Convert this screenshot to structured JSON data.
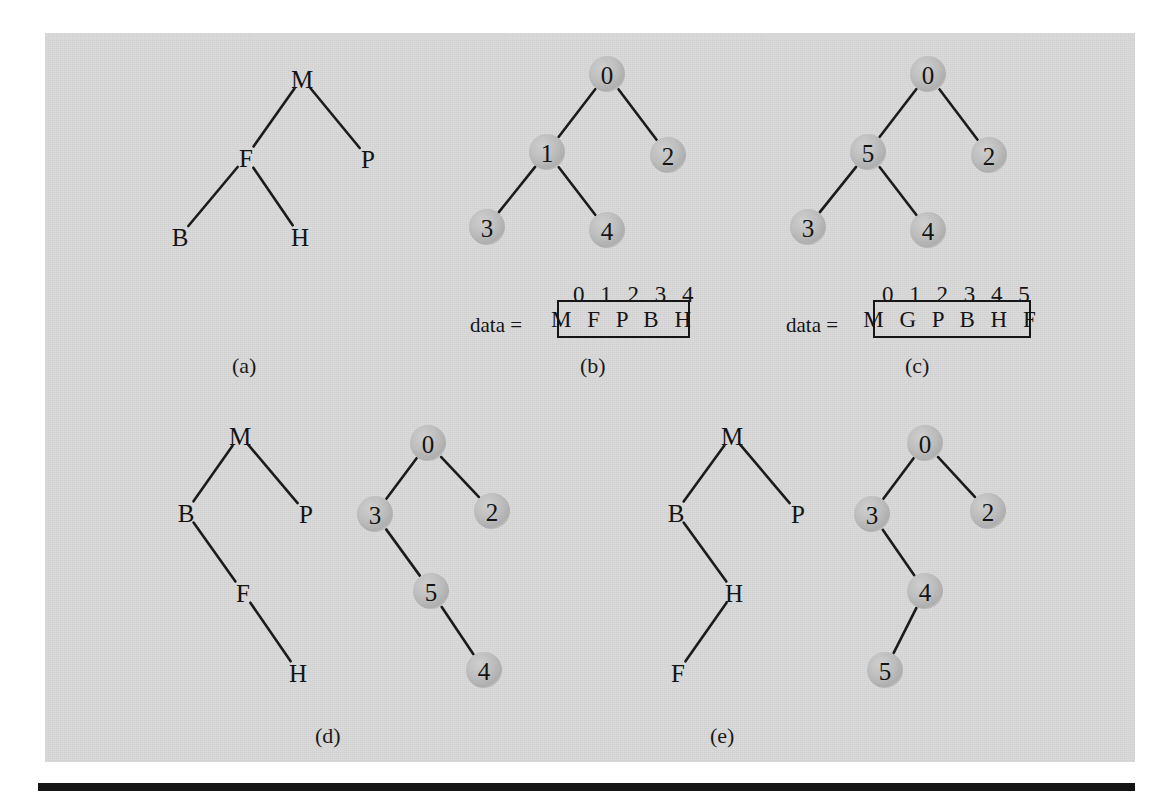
{
  "figure": {
    "background_color": "#ffffff",
    "plate_color": "#d7d7d7",
    "node_fill_color": "#b5b5b5",
    "ink_color": "#141414",
    "rule_color": "#151515"
  },
  "panels": [
    {
      "id": "a",
      "caption": "(a)",
      "kind": "letter-tree",
      "nodes": [
        {
          "label": "M",
          "x": 302,
          "y": 78
        },
        {
          "label": "F",
          "x": 246,
          "y": 157
        },
        {
          "label": "P",
          "x": 368,
          "y": 158
        },
        {
          "label": "B",
          "x": 180,
          "y": 236
        },
        {
          "label": "H",
          "x": 300,
          "y": 236
        }
      ],
      "edges": [
        {
          "from": "M",
          "to": "F"
        },
        {
          "from": "M",
          "to": "P"
        },
        {
          "from": "F",
          "to": "B"
        },
        {
          "from": "F",
          "to": "H"
        }
      ]
    },
    {
      "id": "b",
      "caption": "(b)",
      "kind": "number-tree",
      "nodes": [
        {
          "label": "0",
          "x": 607,
          "y": 74
        },
        {
          "label": "1",
          "x": 547,
          "y": 152
        },
        {
          "label": "2",
          "x": 668,
          "y": 155
        },
        {
          "label": "3",
          "x": 487,
          "y": 227
        },
        {
          "label": "4",
          "x": 607,
          "y": 230
        }
      ],
      "edges": [
        {
          "from": "0",
          "to": "1"
        },
        {
          "from": "0",
          "to": "2"
        },
        {
          "from": "1",
          "to": "3"
        },
        {
          "from": "1",
          "to": "4"
        }
      ],
      "array": {
        "name": "data =",
        "indices": [
          "0",
          "1",
          "2",
          "3",
          "4"
        ],
        "values": [
          "M",
          "F",
          "P",
          "B",
          "H"
        ]
      }
    },
    {
      "id": "c",
      "caption": "(c)",
      "kind": "number-tree",
      "nodes": [
        {
          "label": "0",
          "x": 928,
          "y": 74
        },
        {
          "label": "5",
          "x": 868,
          "y": 152
        },
        {
          "label": "2",
          "x": 989,
          "y": 155
        },
        {
          "label": "3",
          "x": 808,
          "y": 227
        },
        {
          "label": "4",
          "x": 928,
          "y": 230
        }
      ],
      "edges": [
        {
          "from": "0",
          "to": "5"
        },
        {
          "from": "0",
          "to": "2"
        },
        {
          "from": "5",
          "to": "3"
        },
        {
          "from": "5",
          "to": "4"
        }
      ],
      "array": {
        "name": "data =",
        "indices": [
          "0",
          "1",
          "2",
          "3",
          "4",
          "5"
        ],
        "values": [
          "M",
          "G",
          "P",
          "B",
          "H",
          "F"
        ]
      }
    },
    {
      "id": "d",
      "caption": "(d)",
      "kind": "pair",
      "letter_nodes": [
        {
          "label": "M",
          "x": 240,
          "y": 435
        },
        {
          "label": "B",
          "x": 186,
          "y": 512
        },
        {
          "label": "P",
          "x": 306,
          "y": 513
        },
        {
          "label": "F",
          "x": 243,
          "y": 592
        },
        {
          "label": "H",
          "x": 298,
          "y": 672
        }
      ],
      "letter_edges": [
        {
          "from": "M",
          "to": "B"
        },
        {
          "from": "M",
          "to": "P"
        },
        {
          "from": "B",
          "to": "F"
        },
        {
          "from": "F",
          "to": "H"
        }
      ],
      "number_nodes": [
        {
          "label": "0",
          "x": 428,
          "y": 443
        },
        {
          "label": "3",
          "x": 375,
          "y": 514
        },
        {
          "label": "2",
          "x": 492,
          "y": 511
        },
        {
          "label": "5",
          "x": 431,
          "y": 591
        },
        {
          "label": "4",
          "x": 484,
          "y": 670
        }
      ],
      "number_edges": [
        {
          "from": "0",
          "to": "3"
        },
        {
          "from": "0",
          "to": "2"
        },
        {
          "from": "3",
          "to": "5"
        },
        {
          "from": "5",
          "to": "4"
        }
      ]
    },
    {
      "id": "e",
      "caption": "(e)",
      "kind": "pair",
      "letter_nodes": [
        {
          "label": "M",
          "x": 732,
          "y": 435
        },
        {
          "label": "B",
          "x": 676,
          "y": 512
        },
        {
          "label": "P",
          "x": 798,
          "y": 513
        },
        {
          "label": "H",
          "x": 734,
          "y": 592
        },
        {
          "label": "F",
          "x": 678,
          "y": 672
        }
      ],
      "letter_edges": [
        {
          "from": "M",
          "to": "B"
        },
        {
          "from": "M",
          "to": "P"
        },
        {
          "from": "B",
          "to": "H"
        },
        {
          "from": "H",
          "to": "F"
        }
      ],
      "number_nodes": [
        {
          "label": "0",
          "x": 925,
          "y": 443
        },
        {
          "label": "3",
          "x": 872,
          "y": 514
        },
        {
          "label": "2",
          "x": 988,
          "y": 511
        },
        {
          "label": "4",
          "x": 925,
          "y": 591
        },
        {
          "label": "5",
          "x": 885,
          "y": 670
        }
      ],
      "number_edges": [
        {
          "from": "0",
          "to": "3"
        },
        {
          "from": "0",
          "to": "2"
        },
        {
          "from": "3",
          "to": "4"
        },
        {
          "from": "4",
          "to": "5"
        }
      ]
    }
  ],
  "captions": [
    {
      "text": "(a)",
      "x": 232,
      "y": 355
    },
    {
      "text": "(b)",
      "x": 580,
      "y": 355
    },
    {
      "text": "(c)",
      "x": 905,
      "y": 355
    },
    {
      "text": "(d)",
      "x": 315,
      "y": 725
    },
    {
      "text": "(e)",
      "x": 710,
      "y": 725
    }
  ],
  "arrays": [
    {
      "panel": "b",
      "label": "data =",
      "label_x": 470,
      "label_y": 315,
      "indices_text": "0 1 2 3 4",
      "indices_x": 573,
      "indices_y": 283,
      "box_x": 557,
      "box_y": 300,
      "box_w": 133,
      "box_h": 38,
      "values_text": "M F P B H"
    },
    {
      "panel": "c",
      "label": "data =",
      "label_x": 786,
      "label_y": 315,
      "indices_text": "0 1 2 3 4 5",
      "indices_x": 882,
      "indices_y": 283,
      "box_x": 873,
      "box_y": 300,
      "box_w": 158,
      "box_h": 38,
      "values_text": "M G P B H F"
    }
  ]
}
